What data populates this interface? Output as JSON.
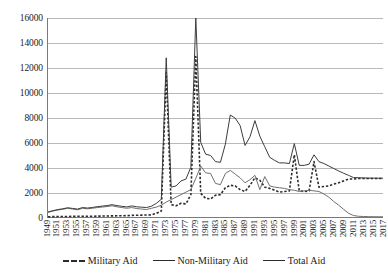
{
  "chart_data": {
    "type": "line",
    "title": "",
    "xlabel": "",
    "ylabel": "",
    "ylim": [
      0,
      16000
    ],
    "y_ticks": [
      0,
      2000,
      4000,
      6000,
      8000,
      10000,
      12000,
      14000,
      16000
    ],
    "grid": true,
    "legend_position": "bottom",
    "x": [
      1949,
      1950,
      1951,
      1952,
      1953,
      1954,
      1955,
      1956,
      1957,
      1958,
      1959,
      1960,
      1961,
      1962,
      1963,
      1964,
      1965,
      1966,
      1967,
      1968,
      1969,
      1970,
      1971,
      1972,
      1973,
      1974,
      1975,
      1976,
      1977,
      1978,
      1979,
      1980,
      1981,
      1982,
      1983,
      1984,
      1985,
      1986,
      1987,
      1988,
      1989,
      1990,
      1991,
      1992,
      1993,
      1994,
      1995,
      1996,
      1997,
      1998,
      1999,
      2000,
      2001,
      2002,
      2003,
      2004,
      2005,
      2006,
      2007,
      2008,
      2009,
      2010,
      2011,
      2012,
      2013,
      2014,
      2015,
      2016,
      2017
    ],
    "x_tick_labels": [
      "1949",
      "1951",
      "1953",
      "1955",
      "1957",
      "1959",
      "1961",
      "1963",
      "1965",
      "1967",
      "1969",
      "1971",
      "1973",
      "1975",
      "1977",
      "1979",
      "1981",
      "1983",
      "1985",
      "1987",
      "1989",
      "1991",
      "1993",
      "1995",
      "1997",
      "1999",
      "2001",
      "2003",
      "2005",
      "2007",
      "2009",
      "2011",
      "2013",
      "2015",
      "2017"
    ],
    "series": [
      {
        "name": "Military Aid",
        "style": "dashed",
        "color": "#2b2b2b",
        "values": [
          20,
          30,
          35,
          40,
          45,
          50,
          55,
          60,
          60,
          65,
          70,
          75,
          80,
          90,
          95,
          100,
          110,
          130,
          140,
          150,
          160,
          170,
          300,
          480,
          11600,
          1000,
          900,
          1100,
          1050,
          1800,
          12900,
          1900,
          1500,
          1450,
          1750,
          1800,
          2350,
          2550,
          2500,
          2200,
          2050,
          2550,
          3150,
          2950,
          2400,
          2300,
          2150,
          2000,
          2050,
          2100,
          5000,
          2100,
          2050,
          2100,
          4450,
          2400,
          2450,
          2500,
          2650,
          2750,
          2900,
          3050,
          3050,
          3100,
          3100,
          3100,
          3100,
          3100,
          3100
        ]
      },
      {
        "name": "Non-Military Aid",
        "style": "solid",
        "color": "#6e6e6e",
        "values": [
          380,
          480,
          560,
          620,
          700,
          640,
          580,
          700,
          660,
          700,
          760,
          800,
          840,
          900,
          820,
          760,
          700,
          760,
          680,
          640,
          600,
          700,
          800,
          950,
          1200,
          1400,
          1600,
          1800,
          2000,
          2200,
          3100,
          4100,
          3550,
          3500,
          2700,
          2600,
          3500,
          3750,
          3450,
          3150,
          2750,
          3000,
          3350,
          2200,
          3250,
          2500,
          2400,
          2350,
          2300,
          2200,
          2150,
          2050,
          2100,
          2150,
          2100,
          2050,
          1850,
          1600,
          1250,
          950,
          620,
          300,
          120,
          60,
          40,
          30,
          25,
          20,
          20
        ]
      },
      {
        "name": "Total Aid",
        "style": "solid",
        "color": "#3a3a3a",
        "values": [
          400,
          510,
          600,
          660,
          745,
          690,
          635,
          760,
          720,
          765,
          830,
          875,
          920,
          990,
          915,
          860,
          810,
          890,
          820,
          790,
          760,
          870,
          1100,
          1430,
          12800,
          2400,
          2500,
          2900,
          3050,
          4000,
          16000,
          6000,
          5050,
          4950,
          4450,
          4400,
          5850,
          8200,
          7950,
          7350,
          5750,
          6450,
          7750,
          6500,
          5650,
          4800,
          4550,
          4350,
          4350,
          4300,
          5900,
          4150,
          4150,
          4250,
          5000,
          4450,
          4300,
          4100,
          3900,
          3700,
          3520,
          3350,
          3170,
          3160,
          3140,
          3130,
          3125,
          3120,
          3120
        ]
      }
    ]
  },
  "legend": {
    "items": [
      {
        "label": "Military Aid",
        "style": "dashed"
      },
      {
        "label": "Non-Military Aid",
        "style": "solid"
      },
      {
        "label": "Total Aid",
        "style": "solid"
      }
    ]
  }
}
